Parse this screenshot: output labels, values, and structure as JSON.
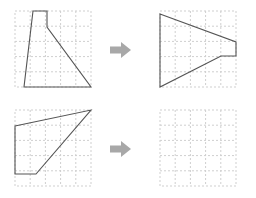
{
  "figure": {
    "type": "rotation-puzzle",
    "colors": {
      "background": "#ffffff",
      "grid_line": "#cfcfcf",
      "shape_stroke": "#555555",
      "shape_fill": "#ffffff",
      "arrow_fill": "#a8a8a8"
    },
    "grid": {
      "columns": 5,
      "rows": 5,
      "cell_size": 15.2,
      "style": "dashed"
    }
  },
  "rows": [
    {
      "name": "row-top",
      "source": {
        "label": "top-left-shape",
        "points": "18,0 32,0 32,16 76,76 9,76",
        "vertices_in_cells": [
          [
            1.2,
            0
          ],
          [
            2.1,
            0
          ],
          [
            2.1,
            1.05
          ],
          [
            5,
            5
          ],
          [
            0.6,
            5
          ]
        ],
        "filled": true
      },
      "arrow": {
        "label": "arrow-right",
        "icon": "arrow-right-icon"
      },
      "result": {
        "label": "top-right-shape",
        "points": "0,3 76,31 76,45 61,45 0,76",
        "vertices_in_cells": [
          [
            0,
            0.2
          ],
          [
            5,
            2.05
          ],
          [
            5,
            2.95
          ],
          [
            4.0,
            2.95
          ],
          [
            0,
            5
          ]
        ],
        "filled": true
      }
    },
    {
      "name": "row-bottom",
      "source": {
        "label": "bottom-left-shape",
        "points": "0,16 76,0 21,64 0,64",
        "vertices_in_cells": [
          [
            0,
            1.05
          ],
          [
            5,
            0
          ],
          [
            1.4,
            4.2
          ],
          [
            0,
            4.2
          ]
        ],
        "filled": true
      },
      "arrow": {
        "label": "arrow-right",
        "icon": "arrow-right-icon"
      },
      "result": {
        "label": "bottom-right-blank",
        "points": "",
        "vertices_in_cells": [],
        "filled": false
      }
    }
  ]
}
